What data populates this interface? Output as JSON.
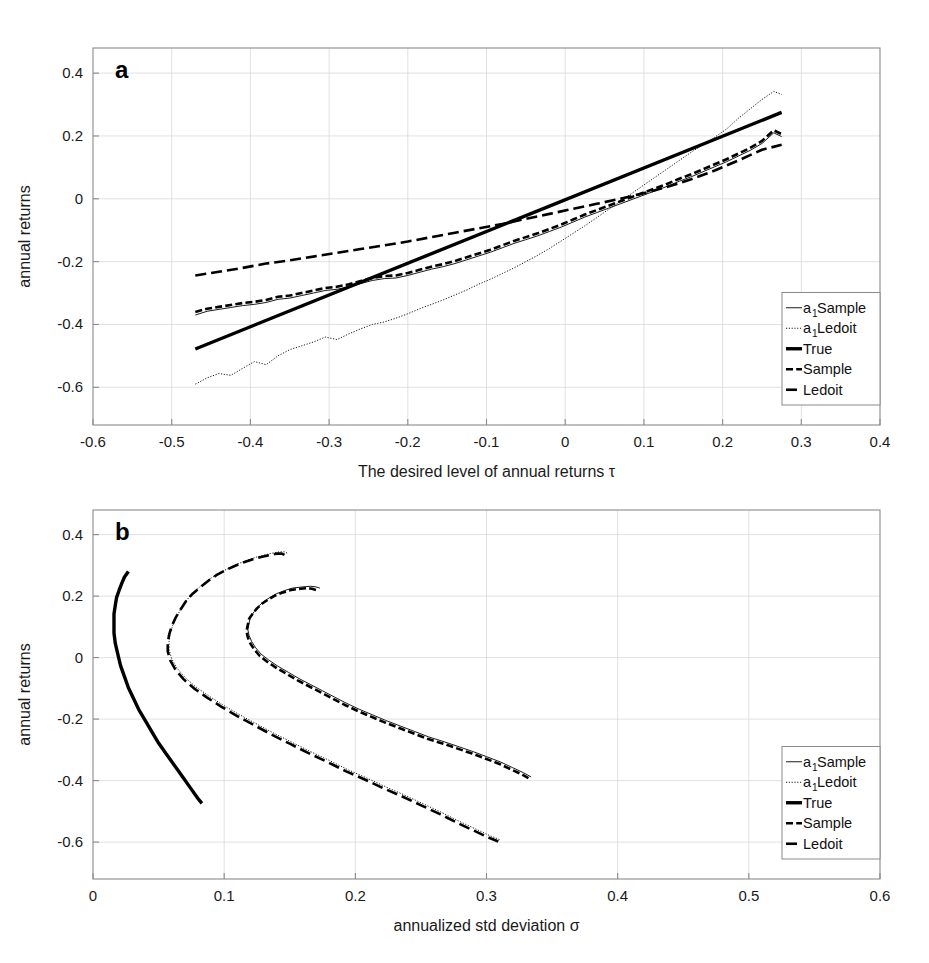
{
  "figure": {
    "background": "#ffffff",
    "ink": "#000000",
    "grid_color": "#d9d9d9",
    "axis_color": "#8a8a8a"
  },
  "panels": [
    {
      "id": "a",
      "letter": "a"
    },
    {
      "id": "b",
      "letter": "b"
    }
  ],
  "legend": {
    "position": "bottom-right",
    "entries": [
      {
        "key": "a1_sample",
        "label": "a",
        "sub": "1",
        "tail": " Sample",
        "style": "thin-solid"
      },
      {
        "key": "a1_ledoit",
        "label": "a",
        "sub": "1",
        "tail": " Ledoit",
        "style": "thin-dotted"
      },
      {
        "key": "true",
        "label": "True",
        "sub": "",
        "tail": "",
        "style": "thick-solid"
      },
      {
        "key": "sample",
        "label": "Sample",
        "sub": "",
        "tail": "",
        "style": "thick-dashed"
      },
      {
        "key": "ledoit",
        "label": "Ledoit",
        "sub": "",
        "tail": "",
        "style": "thick-dashdot"
      }
    ]
  },
  "chart_data": [
    {
      "panel": "a",
      "type": "line",
      "title": "",
      "xlabel": "The desired level of annual returns τ",
      "ylabel": "annual returns",
      "xlim": [
        -0.6,
        0.4
      ],
      "ylim": [
        -0.72,
        0.48
      ],
      "xticks": [
        -0.6,
        -0.5,
        -0.4,
        -0.3,
        -0.2,
        -0.1,
        0,
        0.1,
        0.2,
        0.3,
        0.4
      ],
      "xticklabels": [
        "-0.6",
        "-0.5",
        "-0.4",
        "-0.3",
        "-0.2",
        "-0.1",
        "0",
        "0.1",
        "0.2",
        "0.3",
        "0.4"
      ],
      "yticks": [
        0.4,
        0.2,
        0,
        -0.2,
        -0.4,
        -0.6
      ],
      "yticklabels": [
        "0.4",
        "0.2",
        "0",
        "-0.2",
        "-0.4",
        "-0.6"
      ],
      "grid": true,
      "legend_position": "lower right",
      "series": [
        {
          "name": "a1 Sample",
          "style": "thin-solid",
          "x": [
            -0.47,
            -0.455,
            -0.44,
            -0.425,
            -0.41,
            -0.395,
            -0.38,
            -0.365,
            -0.35,
            -0.335,
            -0.32,
            -0.305,
            -0.29,
            -0.275,
            -0.26,
            -0.245,
            -0.23,
            -0.215,
            -0.2,
            -0.185,
            -0.17,
            -0.155,
            -0.14,
            -0.125,
            -0.11,
            -0.095,
            -0.08,
            -0.065,
            -0.05,
            -0.035,
            -0.02,
            -0.005,
            0.01,
            0.025,
            0.04,
            0.055,
            0.07,
            0.085,
            0.1,
            0.115,
            0.13,
            0.145,
            0.16,
            0.175,
            0.19,
            0.205,
            0.22,
            0.235,
            0.25,
            0.265,
            0.275
          ],
          "y": [
            -0.37,
            -0.358,
            -0.352,
            -0.346,
            -0.34,
            -0.336,
            -0.33,
            -0.32,
            -0.316,
            -0.308,
            -0.3,
            -0.292,
            -0.288,
            -0.28,
            -0.27,
            -0.26,
            -0.254,
            -0.252,
            -0.244,
            -0.234,
            -0.224,
            -0.216,
            -0.206,
            -0.194,
            -0.182,
            -0.17,
            -0.156,
            -0.142,
            -0.13,
            -0.118,
            -0.104,
            -0.09,
            -0.074,
            -0.058,
            -0.044,
            -0.03,
            -0.016,
            -0.002,
            0.012,
            0.026,
            0.04,
            0.056,
            0.07,
            0.086,
            0.102,
            0.118,
            0.136,
            0.154,
            0.176,
            0.21,
            0.198
          ]
        },
        {
          "name": "a1 Ledoit",
          "style": "thin-dotted",
          "x": [
            -0.47,
            -0.455,
            -0.44,
            -0.425,
            -0.41,
            -0.395,
            -0.38,
            -0.365,
            -0.35,
            -0.335,
            -0.32,
            -0.305,
            -0.29,
            -0.275,
            -0.26,
            -0.245,
            -0.23,
            -0.215,
            -0.2,
            -0.185,
            -0.17,
            -0.155,
            -0.14,
            -0.125,
            -0.11,
            -0.095,
            -0.08,
            -0.065,
            -0.05,
            -0.035,
            -0.02,
            -0.005,
            0.01,
            0.025,
            0.04,
            0.055,
            0.07,
            0.085,
            0.1,
            0.115,
            0.13,
            0.145,
            0.16,
            0.175,
            0.19,
            0.205,
            0.22,
            0.235,
            0.25,
            0.265,
            0.275
          ],
          "y": [
            -0.59,
            -0.57,
            -0.556,
            -0.562,
            -0.54,
            -0.518,
            -0.528,
            -0.5,
            -0.48,
            -0.468,
            -0.456,
            -0.44,
            -0.448,
            -0.43,
            -0.414,
            -0.4,
            -0.392,
            -0.38,
            -0.366,
            -0.35,
            -0.336,
            -0.322,
            -0.306,
            -0.29,
            -0.272,
            -0.256,
            -0.238,
            -0.22,
            -0.2,
            -0.18,
            -0.158,
            -0.134,
            -0.11,
            -0.086,
            -0.06,
            -0.034,
            -0.008,
            0.018,
            0.044,
            0.07,
            0.096,
            0.122,
            0.148,
            0.172,
            0.196,
            0.222,
            0.256,
            0.286,
            0.316,
            0.342,
            0.332
          ]
        },
        {
          "name": "True",
          "style": "thick-solid",
          "x": [
            -0.47,
            0.275
          ],
          "y": [
            -0.478,
            0.275
          ]
        },
        {
          "name": "Sample",
          "style": "thick-dashed",
          "x": [
            -0.47,
            -0.455,
            -0.44,
            -0.425,
            -0.41,
            -0.395,
            -0.38,
            -0.365,
            -0.35,
            -0.335,
            -0.32,
            -0.305,
            -0.29,
            -0.275,
            -0.26,
            -0.245,
            -0.23,
            -0.215,
            -0.2,
            -0.185,
            -0.17,
            -0.155,
            -0.14,
            -0.125,
            -0.11,
            -0.095,
            -0.08,
            -0.065,
            -0.05,
            -0.035,
            -0.02,
            -0.005,
            0.01,
            0.025,
            0.04,
            0.055,
            0.07,
            0.085,
            0.1,
            0.115,
            0.13,
            0.145,
            0.16,
            0.175,
            0.19,
            0.205,
            0.22,
            0.235,
            0.25,
            0.265,
            0.275
          ],
          "y": [
            -0.36,
            -0.35,
            -0.344,
            -0.338,
            -0.332,
            -0.328,
            -0.322,
            -0.312,
            -0.308,
            -0.3,
            -0.292,
            -0.284,
            -0.28,
            -0.272,
            -0.262,
            -0.252,
            -0.246,
            -0.244,
            -0.236,
            -0.226,
            -0.216,
            -0.208,
            -0.198,
            -0.186,
            -0.174,
            -0.162,
            -0.148,
            -0.134,
            -0.122,
            -0.11,
            -0.096,
            -0.082,
            -0.066,
            -0.05,
            -0.036,
            -0.022,
            -0.008,
            0.006,
            0.02,
            0.034,
            0.048,
            0.064,
            0.078,
            0.094,
            0.11,
            0.126,
            0.144,
            0.162,
            0.184,
            0.218,
            0.206
          ]
        },
        {
          "name": "Ledoit",
          "style": "thick-dashdot",
          "x": [
            -0.47,
            -0.44,
            -0.41,
            -0.38,
            -0.35,
            -0.32,
            -0.29,
            -0.26,
            -0.23,
            -0.2,
            -0.17,
            -0.14,
            -0.11,
            -0.08,
            -0.05,
            -0.02,
            0.01,
            0.04,
            0.07,
            0.1,
            0.13,
            0.16,
            0.19,
            0.22,
            0.25,
            0.275
          ],
          "y": [
            -0.244,
            -0.232,
            -0.22,
            -0.206,
            -0.196,
            -0.184,
            -0.172,
            -0.16,
            -0.148,
            -0.136,
            -0.122,
            -0.108,
            -0.094,
            -0.08,
            -0.064,
            -0.048,
            -0.032,
            -0.016,
            0.0,
            0.018,
            0.038,
            0.062,
            0.09,
            0.122,
            0.156,
            0.172
          ]
        }
      ]
    },
    {
      "panel": "b",
      "type": "line",
      "title": "",
      "xlabel": "annualized std deviation σ",
      "ylabel": "annual returns",
      "xlim": [
        0,
        0.6
      ],
      "ylim": [
        -0.72,
        0.48
      ],
      "xticks": [
        0,
        0.1,
        0.2,
        0.3,
        0.4,
        0.5,
        0.6
      ],
      "xticklabels": [
        "0",
        "0.1",
        "0.2",
        "0.3",
        "0.4",
        "0.5",
        "0.6"
      ],
      "yticks": [
        0.4,
        0.2,
        0,
        -0.2,
        -0.4,
        -0.6
      ],
      "yticklabels": [
        "0.4",
        "0.2",
        "0",
        "-0.2",
        "-0.4",
        "-0.6"
      ],
      "grid": true,
      "legend_position": "lower right",
      "series": [
        {
          "name": "a1 Sample",
          "style": "thin-solid",
          "x": [
            0.173,
            0.17,
            0.166,
            0.16,
            0.152,
            0.146,
            0.14,
            0.135,
            0.13,
            0.126,
            0.123,
            0.12,
            0.119,
            0.118,
            0.119,
            0.121,
            0.124,
            0.128,
            0.134,
            0.141,
            0.149,
            0.157,
            0.166,
            0.175,
            0.184,
            0.193,
            0.203,
            0.213,
            0.223,
            0.234,
            0.245,
            0.256,
            0.268,
            0.279,
            0.29,
            0.3,
            0.311,
            0.32,
            0.328,
            0.334
          ],
          "y": [
            0.226,
            0.23,
            0.232,
            0.23,
            0.226,
            0.218,
            0.208,
            0.196,
            0.182,
            0.166,
            0.15,
            0.132,
            0.112,
            0.092,
            0.072,
            0.052,
            0.032,
            0.012,
            -0.008,
            -0.028,
            -0.048,
            -0.068,
            -0.088,
            -0.108,
            -0.128,
            -0.148,
            -0.168,
            -0.186,
            -0.204,
            -0.222,
            -0.24,
            -0.258,
            -0.274,
            -0.29,
            -0.306,
            -0.322,
            -0.34,
            -0.358,
            -0.374,
            -0.388
          ]
        },
        {
          "name": "a1 Ledoit",
          "style": "thin-dotted",
          "x": [
            0.148,
            0.146,
            0.142,
            0.137,
            0.131,
            0.124,
            0.117,
            0.11,
            0.103,
            0.096,
            0.089,
            0.083,
            0.077,
            0.072,
            0.068,
            0.064,
            0.061,
            0.059,
            0.058,
            0.058,
            0.06,
            0.064,
            0.07,
            0.078,
            0.088,
            0.099,
            0.111,
            0.124,
            0.137,
            0.151,
            0.165,
            0.18,
            0.194,
            0.209,
            0.223,
            0.238,
            0.252,
            0.266,
            0.279,
            0.291,
            0.302,
            0.31
          ],
          "y": [
            0.34,
            0.344,
            0.344,
            0.34,
            0.334,
            0.326,
            0.316,
            0.304,
            0.29,
            0.274,
            0.256,
            0.236,
            0.214,
            0.19,
            0.164,
            0.136,
            0.108,
            0.08,
            0.052,
            0.026,
            -0.004,
            -0.034,
            -0.064,
            -0.094,
            -0.124,
            -0.154,
            -0.184,
            -0.214,
            -0.244,
            -0.274,
            -0.304,
            -0.334,
            -0.364,
            -0.392,
            -0.42,
            -0.448,
            -0.476,
            -0.504,
            -0.532,
            -0.556,
            -0.578,
            -0.592
          ]
        },
        {
          "name": "True",
          "style": "thick-solid",
          "x": [
            0.027,
            0.024,
            0.022,
            0.02,
            0.018,
            0.017,
            0.016,
            0.016,
            0.016,
            0.017,
            0.019,
            0.021,
            0.024,
            0.027,
            0.031,
            0.035,
            0.04,
            0.045,
            0.05,
            0.056,
            0.062,
            0.068,
            0.074,
            0.08,
            0.083
          ],
          "y": [
            0.28,
            0.262,
            0.242,
            0.22,
            0.196,
            0.17,
            0.142,
            0.112,
            0.08,
            0.046,
            0.01,
            -0.026,
            -0.062,
            -0.098,
            -0.134,
            -0.17,
            -0.206,
            -0.242,
            -0.278,
            -0.314,
            -0.35,
            -0.386,
            -0.422,
            -0.458,
            -0.474
          ]
        },
        {
          "name": "Sample",
          "style": "thick-dashed",
          "x": [
            0.17,
            0.167,
            0.163,
            0.158,
            0.151,
            0.145,
            0.139,
            0.134,
            0.129,
            0.125,
            0.122,
            0.119,
            0.118,
            0.117,
            0.118,
            0.12,
            0.123,
            0.127,
            0.133,
            0.14,
            0.148,
            0.156,
            0.165,
            0.174,
            0.183,
            0.192,
            0.202,
            0.212,
            0.222,
            0.233,
            0.244,
            0.255,
            0.267,
            0.278,
            0.289,
            0.299,
            0.31,
            0.319,
            0.327,
            0.332
          ],
          "y": [
            0.22,
            0.224,
            0.226,
            0.224,
            0.22,
            0.212,
            0.202,
            0.19,
            0.176,
            0.16,
            0.144,
            0.126,
            0.106,
            0.086,
            0.066,
            0.046,
            0.026,
            0.006,
            -0.014,
            -0.034,
            -0.054,
            -0.074,
            -0.094,
            -0.114,
            -0.134,
            -0.154,
            -0.174,
            -0.192,
            -0.21,
            -0.228,
            -0.246,
            -0.264,
            -0.28,
            -0.296,
            -0.312,
            -0.328,
            -0.346,
            -0.364,
            -0.38,
            -0.392
          ]
        },
        {
          "name": "Ledoit",
          "style": "thick-dashdot",
          "x": [
            0.146,
            0.144,
            0.14,
            0.135,
            0.129,
            0.122,
            0.115,
            0.108,
            0.101,
            0.094,
            0.088,
            0.082,
            0.076,
            0.071,
            0.067,
            0.063,
            0.06,
            0.058,
            0.057,
            0.057,
            0.059,
            0.063,
            0.069,
            0.077,
            0.087,
            0.098,
            0.11,
            0.123,
            0.136,
            0.15,
            0.164,
            0.179,
            0.193,
            0.208,
            0.222,
            0.237,
            0.251,
            0.265,
            0.278,
            0.29,
            0.301,
            0.309
          ],
          "y": [
            0.334,
            0.338,
            0.338,
            0.334,
            0.328,
            0.32,
            0.31,
            0.298,
            0.284,
            0.268,
            0.25,
            0.23,
            0.208,
            0.184,
            0.158,
            0.13,
            0.102,
            0.074,
            0.046,
            0.02,
            -0.01,
            -0.04,
            -0.07,
            -0.1,
            -0.13,
            -0.16,
            -0.19,
            -0.22,
            -0.25,
            -0.28,
            -0.31,
            -0.34,
            -0.37,
            -0.398,
            -0.426,
            -0.454,
            -0.482,
            -0.51,
            -0.538,
            -0.562,
            -0.584,
            -0.598
          ]
        }
      ]
    }
  ]
}
